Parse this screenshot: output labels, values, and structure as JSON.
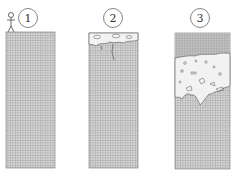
{
  "diagram": {
    "type": "three-stage cross-section illustration",
    "stages": [
      {
        "label": "1",
        "description": "intact block with standing person on top"
      },
      {
        "label": "2",
        "description": "cavities forming near surface, cracks below"
      },
      {
        "label": "3",
        "description": "large cavity zone beneath a capping layer"
      }
    ],
    "colors": {
      "grid": "#8a8a8a",
      "background": "#ffffff",
      "cavity": "#f2f2f2",
      "outline": "#555555"
    }
  }
}
